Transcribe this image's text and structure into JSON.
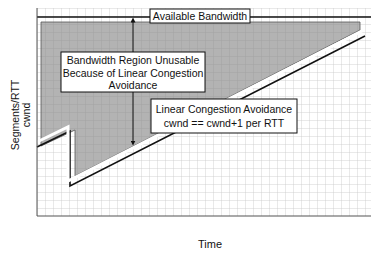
{
  "diagram": {
    "type": "tcp-congestion-avoidance-diagram",
    "labels": {
      "available_bandwidth": "Available Bandwidth",
      "unusable_region_line1": "Bandwidth Region Unusable",
      "unusable_region_line2": "Because of Linear Congestion",
      "unusable_region_line3": "Avoidance",
      "linear_ca_line1": "Linear Congestion Avoidance",
      "linear_ca_line2": "cwnd == cwnd+1 per RTT"
    },
    "axes": {
      "y_label_line1": "Segments/RTT",
      "y_label_line2": "cwnd",
      "x_label": "Time"
    },
    "colors": {
      "shaded_region": "#b3b3b3",
      "grid": "#c8c8c8",
      "line": "#111111",
      "background": "#ffffff"
    }
  }
}
